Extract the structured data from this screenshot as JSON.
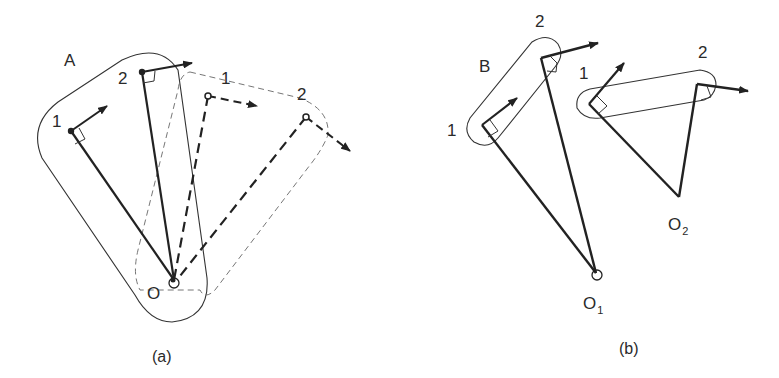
{
  "diagram": {
    "panel_a": {
      "caption": "(a)",
      "body_label": "A",
      "pivot_label": "O",
      "points": [
        {
          "label": "1",
          "role": "original"
        },
        {
          "label": "2",
          "role": "original"
        },
        {
          "label": "1",
          "role": "rotated-dashed"
        },
        {
          "label": "2",
          "role": "rotated-dashed"
        }
      ]
    },
    "panel_b": {
      "caption": "(b)",
      "body_label": "B",
      "pivot_1_label": "O",
      "pivot_1_sub": "1",
      "pivot_2_label": "O",
      "pivot_2_sub": "2",
      "points": [
        {
          "label": "1",
          "role": "body-B"
        },
        {
          "label": "2",
          "role": "body-B"
        },
        {
          "label": "1",
          "role": "translated"
        },
        {
          "label": "2",
          "role": "translated"
        }
      ]
    },
    "colors": {
      "stroke": "#222222",
      "thin_stroke": "#333333",
      "dashed_thin": "#666666"
    }
  }
}
